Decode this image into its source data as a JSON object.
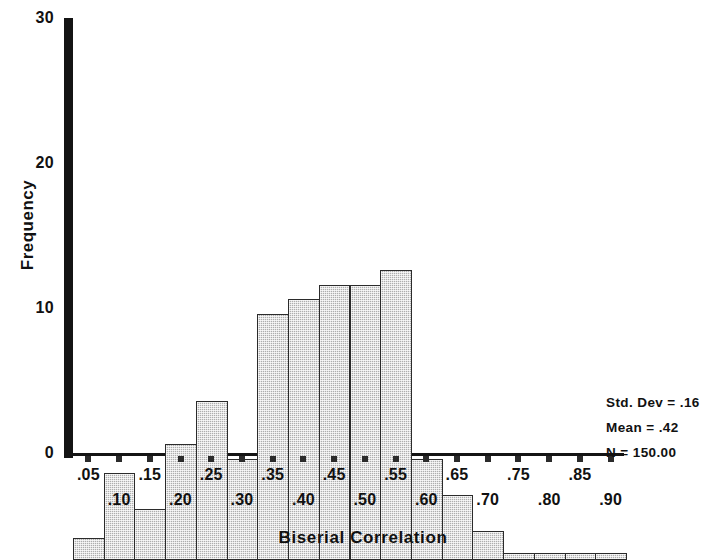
{
  "figure": {
    "kind": "histogram",
    "background_color": "#ffffff",
    "axis_color": "#141414",
    "bar_fill_color": "#c2c2c2",
    "bar_edge_color": "#2b2b2b"
  },
  "titles": {
    "x_axis": "Biserial Correlation",
    "y_axis": "Frequency"
  },
  "y_axis": {
    "ticks": [
      "0",
      "10",
      "20",
      "30"
    ]
  },
  "x_axis": {
    "tick_labels": [
      ".05",
      ".10",
      ".15",
      ".20",
      ".25",
      ".30",
      ".35",
      ".40",
      ".45",
      ".50",
      ".55",
      ".60",
      ".65",
      ".70",
      ".75",
      ".80",
      ".85",
      ".90"
    ]
  },
  "stats": {
    "std_dev": "Std. Dev = .16",
    "mean": "Mean = .42",
    "n": "N = 150.00"
  },
  "chart_data": {
    "type": "bar",
    "title": "",
    "subtitle": "",
    "xlabel": "Biserial Correlation",
    "ylabel": "Frequency",
    "categories": [
      ".05",
      ".10",
      ".15",
      ".20",
      ".25",
      ".30",
      ".35",
      ".40",
      ".45",
      ".50",
      ".55",
      ".60",
      ".65",
      ".70",
      ".75",
      ".80",
      ".85",
      ".90"
    ],
    "values": [
      1.5,
      6,
      3.5,
      8,
      11,
      7,
      17,
      18,
      19,
      19,
      20,
      7,
      4.5,
      2,
      0.5,
      0.5,
      0.5,
      0.5
    ],
    "xlim": [
      0.025,
      0.925
    ],
    "ylim": [
      0,
      30
    ],
    "ytick_values": [
      0,
      10,
      20,
      30
    ],
    "grid": false,
    "legend": "none",
    "annotations": [
      "Std. Dev = .16",
      "Mean = .42",
      "N = 150.00"
    ]
  }
}
